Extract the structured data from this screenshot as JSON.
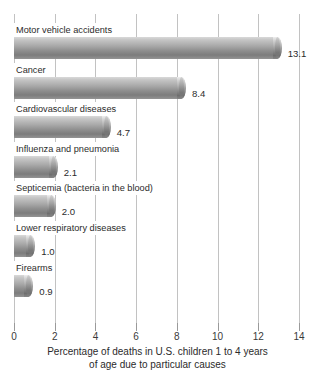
{
  "chart_data": {
    "type": "bar",
    "orientation": "horizontal",
    "title": "",
    "caption_line1": "Percentage of deaths in U.S. children 1 to 4 years",
    "caption_line2": "of age due to particular causes",
    "xlabel": "Percentage of deaths in U.S. children 1 to 4 years of age due to particular causes",
    "ylabel": "",
    "xlim": [
      0,
      14
    ],
    "xticks": [
      0,
      2,
      4,
      6,
      8,
      10,
      12,
      14
    ],
    "xtick_labels": [
      "0",
      "2",
      "4",
      "6",
      "8",
      "10",
      "12",
      "14"
    ],
    "grid": true,
    "legend": false,
    "categories": [
      "Motor vehicle accidents",
      "Cancer",
      "Cardiovascular diseases",
      "Influenza and pneumonia",
      "Septicemia (bacteria in the blood)",
      "Lower respiratory diseases",
      "Firearms"
    ],
    "values": [
      13.1,
      8.4,
      4.7,
      2.1,
      2.0,
      1.0,
      0.9
    ],
    "value_labels": [
      "13.1",
      "8.4",
      "4.7",
      "2.1",
      "2.0",
      "1.0",
      "0.9"
    ],
    "bar_color": "#9a9a9a",
    "grid_color": "#c2c2c2",
    "text_color": "#2b2b2b"
  }
}
